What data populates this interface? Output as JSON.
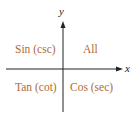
{
  "diagram": {
    "axes": {
      "x_label": "x",
      "y_label": "y"
    },
    "quadrants": {
      "q1": "All",
      "q2": "Sin (csc)",
      "q3": "Tan (cot)",
      "q4": "Cos (sec)"
    },
    "colors": {
      "label_text": "#b06a3a",
      "axis_line": "#222222",
      "background": "#ffffff"
    }
  }
}
